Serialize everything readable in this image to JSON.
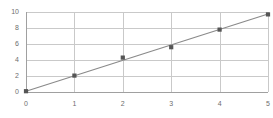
{
  "chart_data": {
    "type": "scatter",
    "title": "",
    "subtitle": "",
    "xlabel": "",
    "ylabel": "",
    "xlim": [
      0,
      5
    ],
    "ylim": [
      0,
      10
    ],
    "grid": true,
    "grid_color": "#c9c9c9",
    "axis_color": "#a0a0a0",
    "legend": false,
    "legend_position": "none",
    "x_ticks": [
      "0",
      "1",
      "2",
      "3",
      "4",
      "5"
    ],
    "y_ticks": [
      "0",
      "2",
      "4",
      "6",
      "8",
      "10"
    ],
    "x_tick_values": [
      0,
      1,
      2,
      3,
      4,
      5
    ],
    "y_tick_values": [
      0,
      2,
      4,
      6,
      8,
      10
    ],
    "series": [
      {
        "name": "data points",
        "type": "scatter",
        "marker": "square",
        "color": "#555555",
        "x": [
          0,
          1,
          2,
          3,
          4,
          5
        ],
        "values": [
          0.1,
          2.05,
          4.3,
          5.6,
          7.8,
          9.7
        ]
      },
      {
        "name": "trend line",
        "type": "line",
        "color": "#8a8a8a",
        "x": [
          0,
          5
        ],
        "values": [
          0.1,
          9.75
        ]
      }
    ]
  },
  "axes": {
    "y_axis_name": "y-axis",
    "x_axis_name": "x-axis"
  }
}
